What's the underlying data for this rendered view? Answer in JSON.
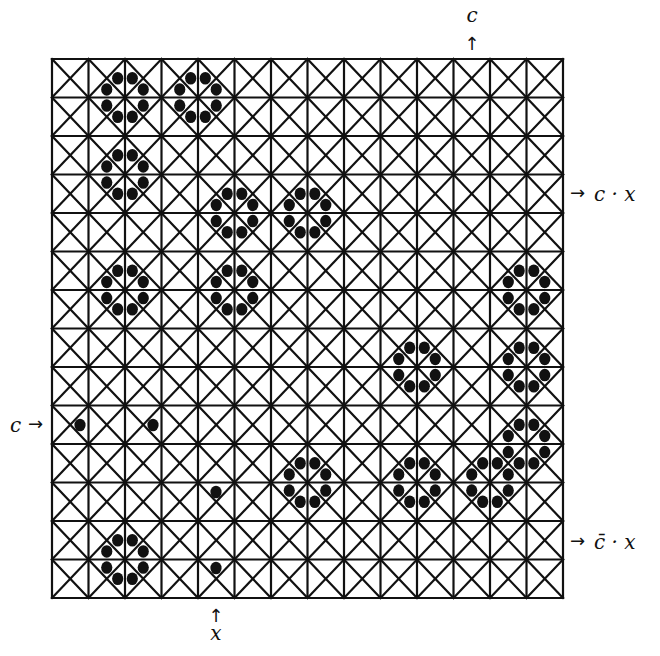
{
  "figure": {
    "grid": {
      "cols": 14,
      "rows": 14,
      "x0": 52,
      "y0": 59,
      "x1": 563,
      "y1": 598,
      "line_color": "#111111",
      "cell_diagonals": true
    },
    "dot_color": "#111111",
    "octagons": [
      {
        "vcol": 2,
        "vrow": 1
      },
      {
        "vcol": 4,
        "vrow": 1
      },
      {
        "vcol": 2,
        "vrow": 3
      },
      {
        "vcol": 5,
        "vrow": 4
      },
      {
        "vcol": 7,
        "vrow": 4
      },
      {
        "vcol": 2,
        "vrow": 6
      },
      {
        "vcol": 5,
        "vrow": 6
      },
      {
        "vcol": 13,
        "vrow": 6
      },
      {
        "vcol": 10,
        "vrow": 8
      },
      {
        "vcol": 13,
        "vrow": 8
      },
      {
        "vcol": 13,
        "vrow": 10
      },
      {
        "vcol": 7,
        "vrow": 11
      },
      {
        "vcol": 10,
        "vrow": 11
      },
      {
        "vcol": 12,
        "vrow": 11
      },
      {
        "vcol": 2,
        "vrow": 13
      }
    ],
    "single_dots": [
      {
        "x": 80,
        "y": 425
      },
      {
        "x": 153,
        "y": 425
      },
      {
        "x": 216,
        "y": 492
      },
      {
        "x": 216,
        "y": 568
      }
    ],
    "labels": {
      "top": {
        "text": "c",
        "arrow": "↑",
        "x": 472,
        "y": 22
      },
      "bottom": {
        "text": "x",
        "arrow": "↑",
        "x": 216,
        "y": 640
      },
      "left": {
        "text": "c",
        "arrow": "→",
        "x": 10,
        "y": 432
      },
      "right_upper": {
        "text": "c · x",
        "arrow": "→",
        "x": 570,
        "y": 201
      },
      "right_lower": {
        "text": "c̄ · x",
        "arrow": "→",
        "x": 570,
        "y": 549
      }
    }
  }
}
